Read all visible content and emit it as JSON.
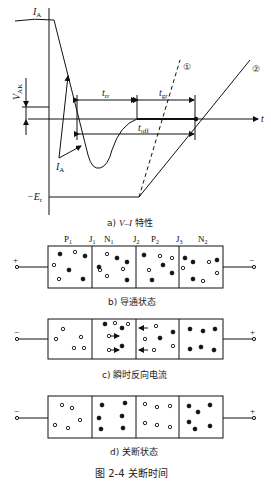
{
  "figure": {
    "caption": "图 2-4    关断时间"
  },
  "panel_a": {
    "caption_prefix": "a) ",
    "caption_italic": "V–I",
    "caption_suffix": " 特性",
    "labels": {
      "ia_top": "I",
      "ia_top_sub": "A",
      "ia_bottom": "I",
      "ia_bottom_sub": "A",
      "vak": "V",
      "vak_sub": "AK",
      "t_axis": "t",
      "t_rr": "t",
      "t_rr_sub": "rr",
      "t_gr": "t",
      "t_gr_sub": "gr",
      "t_off": "t",
      "t_off_sub": "off",
      "neg_er": "−E",
      "neg_er_sub": "r",
      "curve1": "①",
      "curve2": "②"
    }
  },
  "panel_b": {
    "caption": "b) 导通状态",
    "region_labels": [
      "P",
      "J",
      "N",
      "J",
      "P",
      "J",
      "N"
    ],
    "region_subs": [
      "1",
      "1",
      "1",
      "2",
      "2",
      "3",
      "2"
    ],
    "left_terminal": "+",
    "right_terminal": "−"
  },
  "panel_c": {
    "caption": "c) 瞬时反向电流",
    "left_terminal": "−",
    "right_terminal": "+"
  },
  "panel_d": {
    "caption": "d) 关断状态",
    "left_terminal": "−",
    "right_terminal": "+"
  },
  "legend_semantics": {
    "filled_dot": "electron",
    "hollow_dot": "hole"
  }
}
